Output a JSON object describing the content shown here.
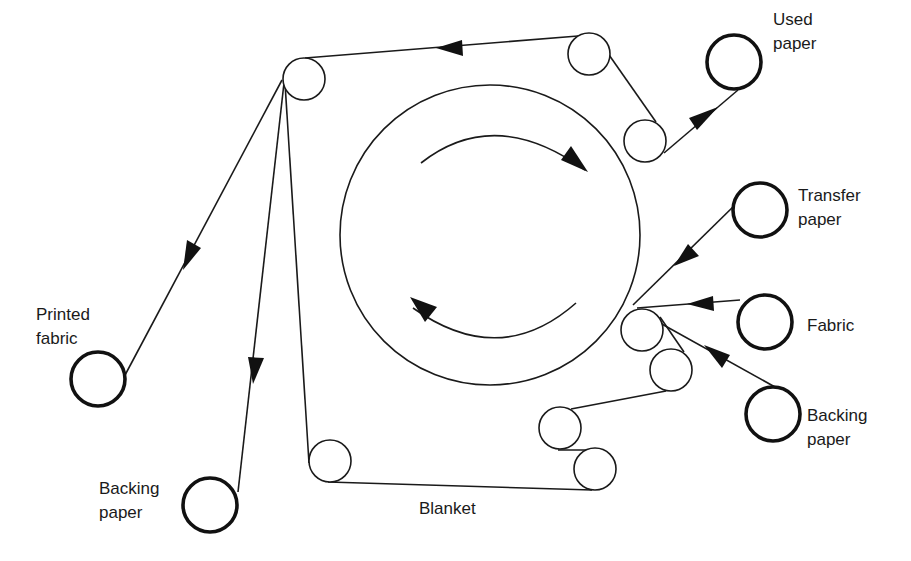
{
  "diagram": {
    "type": "transfer printing calender machine",
    "labels": {
      "used_paper": "Used\npaper",
      "transfer_paper": "Transfer\npaper",
      "fabric": "Fabric",
      "backing_paper_right": "Backing\npaper",
      "printed_fabric": "Printed\nfabric",
      "backing_paper_left": "Backing\npaper",
      "blanket": "Blanket"
    },
    "colors": {
      "line": "#1a1a1a",
      "background": "#ffffff"
    }
  }
}
